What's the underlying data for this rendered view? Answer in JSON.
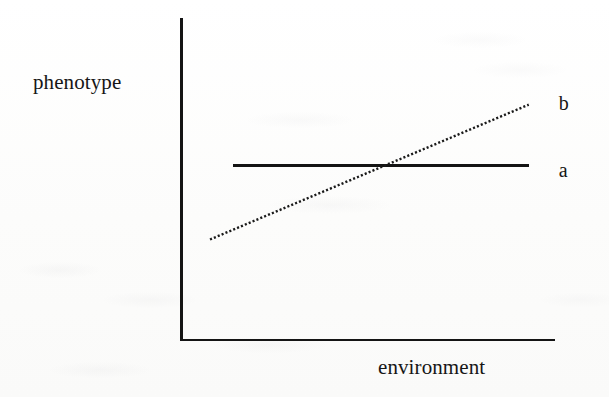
{
  "figure": {
    "type": "reaction-norm-plot",
    "background_color": "#fdfdfc",
    "ink_color": "#141414"
  },
  "axes": {
    "y_label": "phenotype",
    "x_label": "environment",
    "y_axis_name": "y-axis-line",
    "x_axis_name": "x-axis-line",
    "ticks": [],
    "tick_labels": []
  },
  "series_labels": {
    "a": "a",
    "b": "b"
  },
  "chart_data": {
    "type": "line",
    "title": "",
    "subtitle": "",
    "xlabel": "environment",
    "ylabel": "phenotype",
    "xlim": [
      0,
      1
    ],
    "ylim": [
      0,
      1
    ],
    "grid": false,
    "legend_position": "right-inline",
    "axis_tick_labels": {
      "x": [],
      "y": []
    },
    "series": [
      {
        "name": "a",
        "label": "a",
        "style": "solid",
        "linewidth": 3,
        "color": "#141414",
        "description": "flat reaction norm - phenotype constant across environment",
        "x": [
          0.14,
          0.93
        ],
        "y": [
          0.54,
          0.54
        ],
        "label_position": {
          "x": 1.01,
          "y": 0.52
        }
      },
      {
        "name": "b",
        "label": "b",
        "style": "dotted",
        "linewidth": 2,
        "color": "#1a1a1a",
        "description": "sloped reaction norm - phenotype increases with environment",
        "x": [
          0.08,
          0.93
        ],
        "y": [
          0.31,
          0.73
        ],
        "label_position": {
          "x": 1.01,
          "y": 0.73
        }
      }
    ],
    "annotations": [
      {
        "text": "a",
        "x": 1.01,
        "y": 0.52
      },
      {
        "text": "b",
        "x": 1.01,
        "y": 0.73
      }
    ]
  }
}
